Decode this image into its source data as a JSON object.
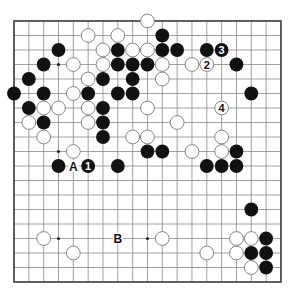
{
  "board": {
    "size": 19,
    "origin_x": 14,
    "origin_y": 21,
    "step_x": 14.83,
    "step_y": 14.5,
    "line_color": "#8a8a8a",
    "border_color": "#444444",
    "star_points": [
      [
        3,
        3
      ],
      [
        9,
        3
      ],
      [
        15,
        3
      ],
      [
        3,
        9
      ],
      [
        9,
        9
      ],
      [
        15,
        9
      ],
      [
        3,
        15
      ],
      [
        9,
        15
      ],
      [
        15,
        15
      ]
    ]
  },
  "colors": {
    "black_stone": "#111111",
    "white_stone_fill": "#ffffff",
    "white_stone_stroke": "#777777",
    "label_text": "#111111"
  },
  "stones": {
    "black": [
      {
        "x": 10,
        "y": 1
      },
      {
        "x": 3,
        "y": 2
      },
      {
        "x": 7,
        "y": 2
      },
      {
        "x": 10,
        "y": 2
      },
      {
        "x": 11,
        "y": 2
      },
      {
        "x": 13,
        "y": 2
      },
      {
        "x": 14,
        "y": 2,
        "label": "3"
      },
      {
        "x": 2,
        "y": 3
      },
      {
        "x": 7,
        "y": 3
      },
      {
        "x": 8,
        "y": 3
      },
      {
        "x": 9,
        "y": 3
      },
      {
        "x": 15,
        "y": 3
      },
      {
        "x": 1,
        "y": 4
      },
      {
        "x": 6,
        "y": 4
      },
      {
        "x": 8,
        "y": 4
      },
      {
        "x": 0,
        "y": 5
      },
      {
        "x": 2,
        "y": 5
      },
      {
        "x": 5,
        "y": 5
      },
      {
        "x": 7,
        "y": 5
      },
      {
        "x": 8,
        "y": 5
      },
      {
        "x": 16,
        "y": 5
      },
      {
        "x": 1,
        "y": 6
      },
      {
        "x": 6,
        "y": 6
      },
      {
        "x": 2,
        "y": 7
      },
      {
        "x": 6,
        "y": 7
      },
      {
        "x": 6,
        "y": 8
      },
      {
        "x": 9,
        "y": 9
      },
      {
        "x": 10,
        "y": 9
      },
      {
        "x": 15,
        "y": 9
      },
      {
        "x": 3,
        "y": 10
      },
      {
        "x": 5,
        "y": 10,
        "label": "1"
      },
      {
        "x": 7,
        "y": 10
      },
      {
        "x": 13,
        "y": 10
      },
      {
        "x": 14,
        "y": 10
      },
      {
        "x": 15,
        "y": 10
      },
      {
        "x": 16,
        "y": 13
      },
      {
        "x": 17,
        "y": 15
      },
      {
        "x": 16,
        "y": 16
      },
      {
        "x": 17,
        "y": 16
      },
      {
        "x": 17,
        "y": 17
      }
    ],
    "white": [
      {
        "x": 9,
        "y": 0
      },
      {
        "x": 5,
        "y": 1
      },
      {
        "x": 7,
        "y": 1
      },
      {
        "x": 6,
        "y": 2
      },
      {
        "x": 8,
        "y": 2
      },
      {
        "x": 9,
        "y": 2
      },
      {
        "x": 4,
        "y": 3
      },
      {
        "x": 6,
        "y": 3
      },
      {
        "x": 10,
        "y": 3
      },
      {
        "x": 12,
        "y": 3
      },
      {
        "x": 13,
        "y": 3,
        "label": "2"
      },
      {
        "x": 5,
        "y": 4
      },
      {
        "x": 10,
        "y": 4
      },
      {
        "x": 4,
        "y": 5
      },
      {
        "x": 2,
        "y": 6
      },
      {
        "x": 3,
        "y": 6
      },
      {
        "x": 5,
        "y": 6
      },
      {
        "x": 9,
        "y": 6
      },
      {
        "x": 14,
        "y": 6,
        "label": "4"
      },
      {
        "x": 1,
        "y": 7
      },
      {
        "x": 5,
        "y": 7
      },
      {
        "x": 11,
        "y": 7
      },
      {
        "x": 2,
        "y": 8
      },
      {
        "x": 8,
        "y": 8
      },
      {
        "x": 9,
        "y": 8
      },
      {
        "x": 14,
        "y": 8
      },
      {
        "x": 4,
        "y": 9
      },
      {
        "x": 12,
        "y": 9
      },
      {
        "x": 14,
        "y": 9
      },
      {
        "x": 2,
        "y": 15
      },
      {
        "x": 10,
        "y": 15
      },
      {
        "x": 15,
        "y": 15
      },
      {
        "x": 16,
        "y": 15
      },
      {
        "x": 4,
        "y": 16
      },
      {
        "x": 13,
        "y": 16
      },
      {
        "x": 15,
        "y": 16
      },
      {
        "x": 16,
        "y": 17
      }
    ]
  },
  "markers": [
    {
      "x": 4,
      "y": 10,
      "label": "A"
    },
    {
      "x": 7,
      "y": 15,
      "label": "B"
    }
  ]
}
